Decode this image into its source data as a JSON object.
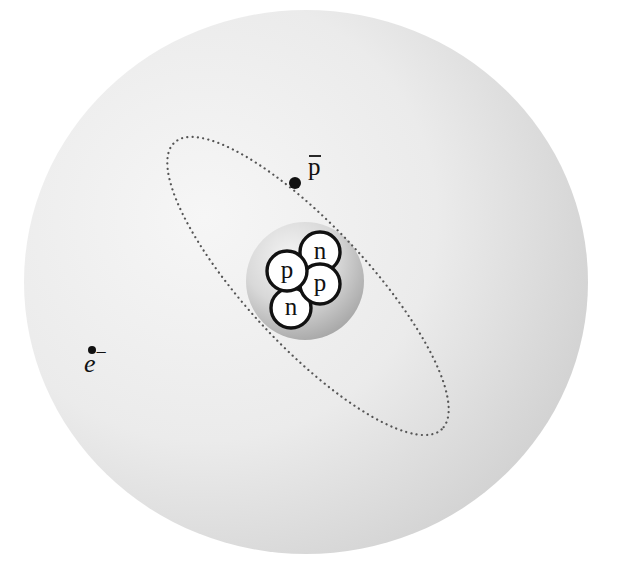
{
  "diagram": {
    "type": "antiprotonic-helium-atom",
    "colors": {
      "background": "#ffffff",
      "cloud_light": "#f4f4f4",
      "cloud_dark": "#d2d2d2",
      "nucleus_light": "#f2f2f2",
      "nucleus_dark": "#a9a9a9",
      "nucleon_fill": "#ffffff",
      "outline": "#111111",
      "orbit": "#555555"
    },
    "electron_cloud": {
      "cx": 306,
      "cy": 282,
      "rx": 282,
      "ry": 272
    },
    "orbit": {
      "cx": 308,
      "cy": 286,
      "rx": 196,
      "ry": 60,
      "rotation_deg": 47,
      "style": "dotted"
    },
    "nucleus": {
      "sphere": {
        "cx": 305,
        "cy": 281,
        "r": 59
      },
      "nucleons": [
        {
          "label": "n",
          "kind": "neutron",
          "cx": 320,
          "cy": 252,
          "r": 20
        },
        {
          "label": "n",
          "kind": "neutron",
          "cx": 291,
          "cy": 308,
          "r": 20
        },
        {
          "label": "p",
          "kind": "proton",
          "cx": 320,
          "cy": 284,
          "r": 20
        },
        {
          "label": "p",
          "kind": "proton",
          "cx": 287,
          "cy": 271,
          "r": 20
        }
      ]
    },
    "particles": {
      "antiproton": {
        "label": "p",
        "bar": true,
        "symbol": "p̄",
        "x": 295,
        "y": 183,
        "label_x": 308,
        "label_y": 175
      },
      "electron": {
        "label": "e",
        "superscript": "−",
        "symbol": "e−",
        "x": 92,
        "y": 350,
        "label_x": 84,
        "label_y": 372
      }
    }
  }
}
